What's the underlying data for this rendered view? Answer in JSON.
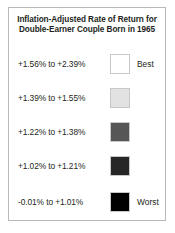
{
  "legend": {
    "title_line1": "Inflation-Adjusted Rate of Return for",
    "title_line2": "Double-Earner Couple Born in 1965",
    "rows": [
      {
        "range": "+1.56% to +2.39%",
        "color": "#ffffff",
        "rank": "Best"
      },
      {
        "range": "+1.39% to +1.55%",
        "color": "#e2e2e2",
        "rank": ""
      },
      {
        "range": "+1.22% to +1.38%",
        "color": "#565656",
        "rank": ""
      },
      {
        "range": "+1.02% to +1.21%",
        "color": "#262626",
        "rank": ""
      },
      {
        "range": "-0.01% to +1.01%",
        "color": "#000000",
        "rank": "Worst"
      }
    ]
  },
  "chart_data": {
    "type": "table",
    "title": "Inflation-Adjusted Rate of Return for Double-Earner Couple Born in 1965",
    "xlabel": "",
    "ylabel": "",
    "legend_position": "standalone",
    "grid": false,
    "categories": [
      "+1.56% to +2.39%",
      "+1.39% to +1.55%",
      "+1.22% to +1.38%",
      "+1.02% to +1.21%",
      "-0.01% to +1.01%"
    ],
    "values": [
      {
        "label": "+1.56% to +2.39%",
        "min": 1.56,
        "max": 2.39,
        "color": "#ffffff",
        "annotation": "Best"
      },
      {
        "label": "+1.39% to +1.55%",
        "min": 1.39,
        "max": 1.55,
        "color": "#e2e2e2",
        "annotation": ""
      },
      {
        "label": "+1.22% to +1.38%",
        "min": 1.22,
        "max": 1.38,
        "color": "#565656",
        "annotation": ""
      },
      {
        "label": "+1.02% to +1.21%",
        "min": 1.02,
        "max": 1.21,
        "color": "#262626",
        "annotation": ""
      },
      {
        "label": "-0.01% to +1.01%",
        "min": -0.01,
        "max": 1.01,
        "color": "#000000",
        "annotation": "Worst"
      }
    ],
    "units": "percent",
    "annotations": [
      "Best",
      "Worst"
    ]
  }
}
